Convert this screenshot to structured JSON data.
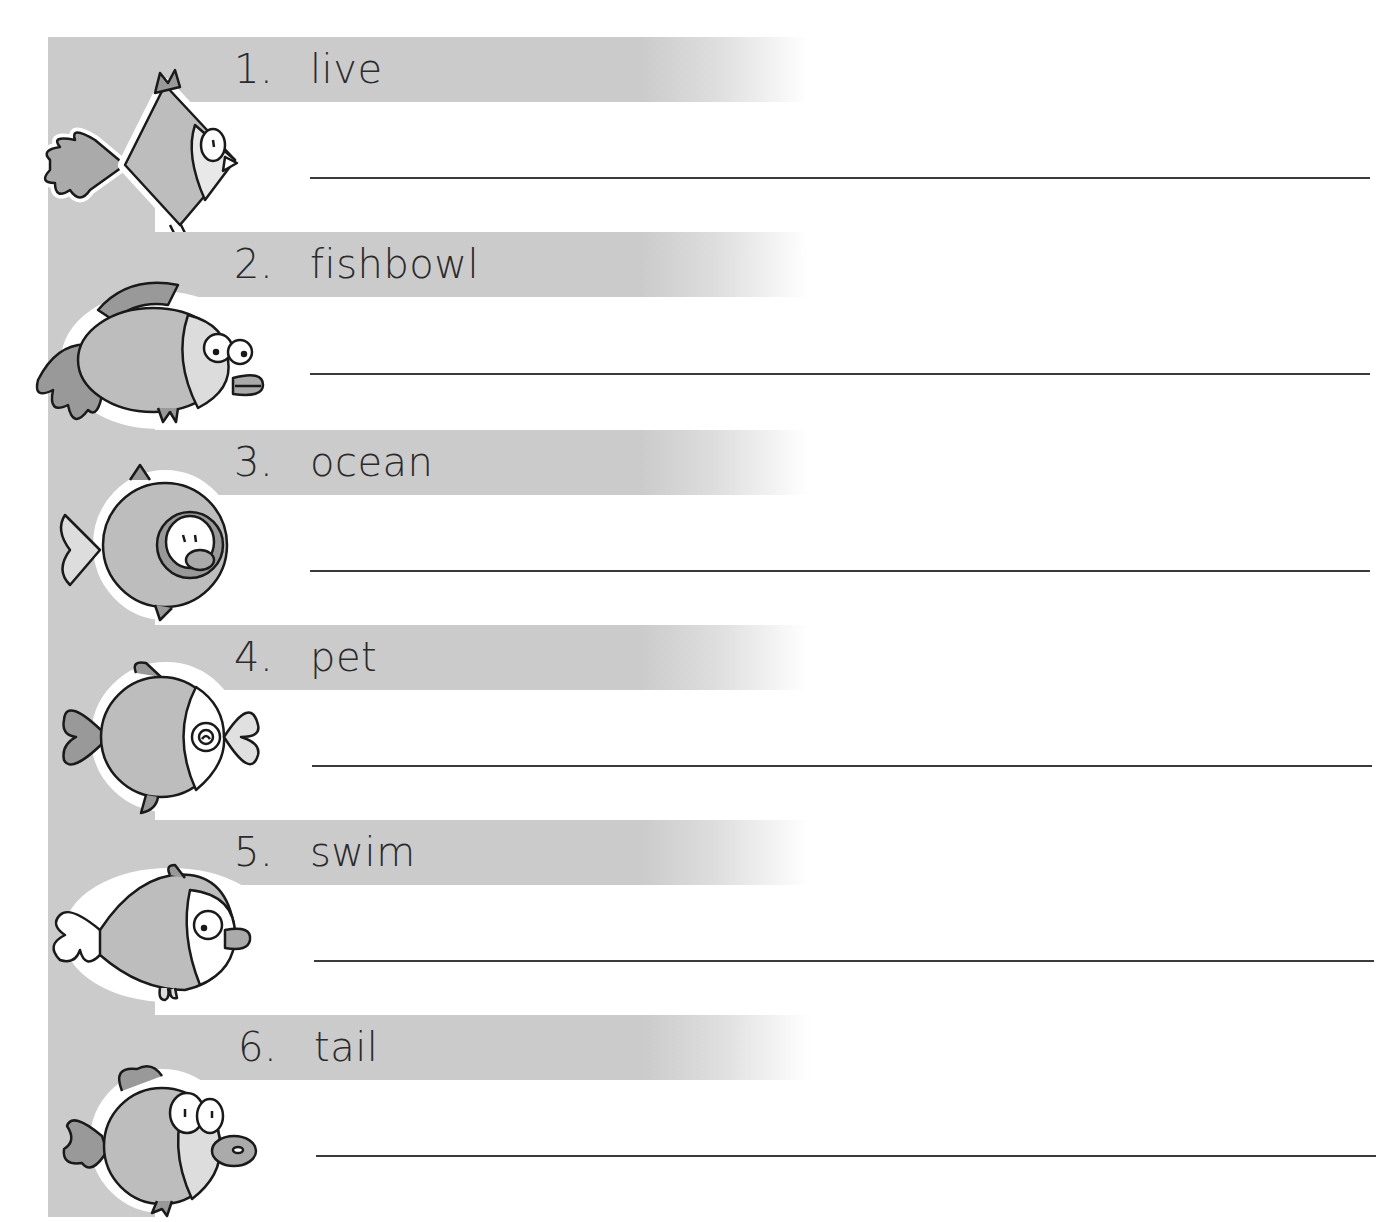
{
  "worksheet": {
    "items": [
      {
        "number": "1.",
        "word": "live",
        "answer": "",
        "fish_icon": "diamond-fish-icon"
      },
      {
        "number": "2.",
        "word": "fishbowl",
        "answer": "",
        "fish_icon": "goldfish-icon"
      },
      {
        "number": "3.",
        "word": "ocean",
        "answer": "",
        "fish_icon": "round-fish-icon"
      },
      {
        "number": "4.",
        "word": "pet",
        "answer": "",
        "fish_icon": "ball-fish-icon"
      },
      {
        "number": "5.",
        "word": "swim",
        "answer": "",
        "fish_icon": "long-fish-icon"
      },
      {
        "number": "6.",
        "word": "tail",
        "answer": "",
        "fish_icon": "bug-eyed-fish-icon"
      }
    ],
    "colors": {
      "band_gray": "#cbcbcb",
      "text": "#2b2b2b",
      "line": "#3a3a3a",
      "fish_fill": "#bdbdbd",
      "fish_outline": "#1a1a1a"
    }
  }
}
